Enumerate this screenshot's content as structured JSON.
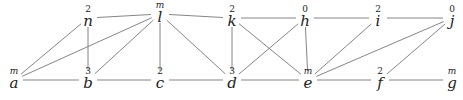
{
  "graph": {
    "nodes": [
      {
        "id": "a",
        "label": "a",
        "mark": "m",
        "x": 14,
        "y": 85
      },
      {
        "id": "b",
        "label": "b",
        "mark": "3",
        "x": 88,
        "y": 85
      },
      {
        "id": "c",
        "label": "c",
        "mark": "2",
        "x": 160,
        "y": 85
      },
      {
        "id": "d",
        "label": "d",
        "mark": "3",
        "x": 232,
        "y": 85
      },
      {
        "id": "e",
        "label": "e",
        "mark": "m",
        "x": 308,
        "y": 85
      },
      {
        "id": "f",
        "label": "f",
        "mark": "2",
        "x": 380,
        "y": 85
      },
      {
        "id": "g",
        "label": "g",
        "mark": "m",
        "x": 452,
        "y": 85
      },
      {
        "id": "n",
        "label": "n",
        "mark": "2",
        "x": 88,
        "y": 23
      },
      {
        "id": "l",
        "label": "l",
        "mark": "m",
        "x": 160,
        "y": 19
      },
      {
        "id": "k",
        "label": "k",
        "mark": "2",
        "x": 232,
        "y": 23
      },
      {
        "id": "h",
        "label": "h",
        "mark": "0",
        "x": 305,
        "y": 23
      },
      {
        "id": "i",
        "label": "i",
        "mark": "2",
        "x": 378,
        "y": 23
      },
      {
        "id": "j",
        "label": "j",
        "mark": "0",
        "x": 452,
        "y": 23
      }
    ],
    "edges": [
      [
        "a",
        "n"
      ],
      [
        "a",
        "l"
      ],
      [
        "a",
        "b"
      ],
      [
        "n",
        "l"
      ],
      [
        "n",
        "b"
      ],
      [
        "b",
        "l"
      ],
      [
        "b",
        "c"
      ],
      [
        "l",
        "c"
      ],
      [
        "l",
        "k"
      ],
      [
        "l",
        "d"
      ],
      [
        "c",
        "d"
      ],
      [
        "k",
        "h"
      ],
      [
        "k",
        "d"
      ],
      [
        "k",
        "e"
      ],
      [
        "h",
        "d"
      ],
      [
        "h",
        "e"
      ],
      [
        "d",
        "e"
      ],
      [
        "h",
        "i"
      ],
      [
        "i",
        "j"
      ],
      [
        "i",
        "e"
      ],
      [
        "j",
        "e"
      ],
      [
        "j",
        "f"
      ],
      [
        "e",
        "f"
      ],
      [
        "f",
        "g"
      ]
    ]
  }
}
